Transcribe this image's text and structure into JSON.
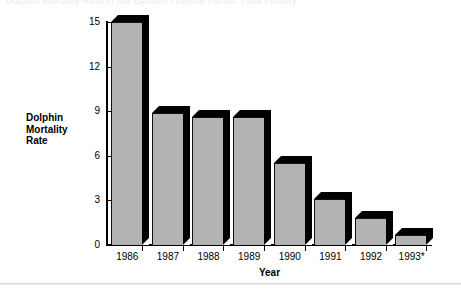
{
  "figure": {
    "cut_off_title": "Dolphin Mortality Rate in the Eastern Tropical Pacific Tuna Fishery"
  },
  "chart_data": {
    "type": "bar",
    "title": "",
    "categories": [
      "1986",
      "1987",
      "1988",
      "1989",
      "1990",
      "1991",
      "1992",
      "1993*"
    ],
    "values": [
      15.0,
      8.9,
      8.6,
      8.6,
      5.5,
      3.1,
      1.8,
      0.7
    ],
    "xlabel": "Year",
    "ylabel": "Dolphin Mortality Rate",
    "ylabel_lines": [
      "Dolphin",
      "Mortality",
      "Rate"
    ],
    "ylim": [
      0,
      15
    ],
    "yticks": [
      0,
      3,
      6,
      9,
      12,
      15
    ],
    "ytick_labels": [
      "0",
      "3",
      "6",
      "9",
      "12",
      "15"
    ],
    "grid": false,
    "legend": null,
    "bar_color": "#b3b3b3",
    "bar_shadow_color": "#000000",
    "axis_color": "#000000",
    "background": "#ffffff",
    "footnote_marker": "*"
  }
}
